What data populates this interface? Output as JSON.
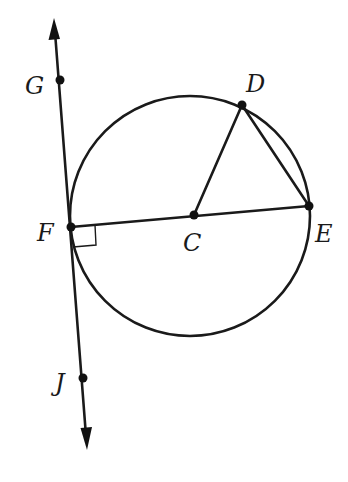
{
  "figure": {
    "type": "geometry",
    "colors": {
      "ink": "#1a1a1a",
      "background": "#ffffff"
    }
  },
  "points": {
    "G": {
      "label": "G",
      "x": 60,
      "y": 80
    },
    "F": {
      "label": "F",
      "x": 71,
      "y": 227
    },
    "J": {
      "label": "J",
      "x": 83,
      "y": 378
    },
    "C": {
      "label": "C",
      "x": 194,
      "y": 215
    },
    "D": {
      "label": "D",
      "x": 242,
      "y": 105
    },
    "E": {
      "label": "E",
      "x": 309,
      "y": 206
    }
  },
  "circle": {
    "center": "C",
    "cx": 190,
    "cy": 216,
    "r": 120
  },
  "segments": [
    {
      "name": "FE",
      "from": "F",
      "to": "E",
      "kind": "diameter"
    },
    {
      "name": "CD",
      "from": "C",
      "to": "D",
      "kind": "radius"
    },
    {
      "name": "DE",
      "from": "D",
      "to": "E",
      "kind": "chord"
    }
  ],
  "line": {
    "name": "GJ",
    "through": [
      "G",
      "F",
      "J"
    ],
    "arrows": "both",
    "kind": "tangent"
  },
  "marks": [
    {
      "type": "right-angle",
      "at": "F",
      "between": [
        "FE",
        "GJ"
      ]
    }
  ],
  "labels": {
    "G": "G",
    "D": "D",
    "F": "F",
    "C": "C",
    "E": "E",
    "J": "J"
  }
}
